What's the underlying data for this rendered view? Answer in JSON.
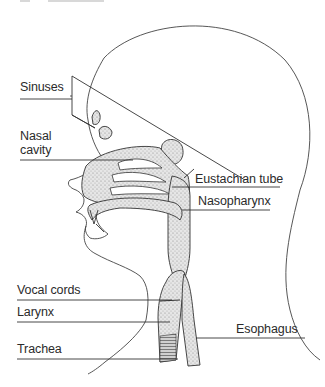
{
  "diagram": {
    "colors": {
      "line": "#333333",
      "fill": "#d9d9d9",
      "text": "#2b2b2b"
    },
    "labels": {
      "sinuses": "Sinuses",
      "nasal_cavity_1": "Nasal",
      "nasal_cavity_2": "cavity",
      "eustachian_tube": "Eustachian tube",
      "nasopharynx": "Nasopharynx",
      "vocal_cords": "Vocal cords",
      "larynx": "Larynx",
      "trachea": "Trachea",
      "esophagus": "Esophagus"
    }
  }
}
